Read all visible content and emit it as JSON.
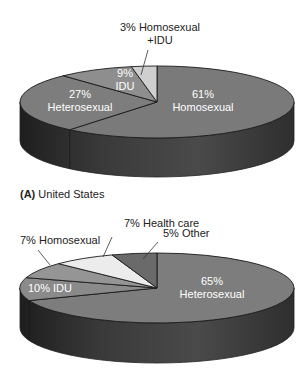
{
  "figure": {
    "panel_label_letter": "(A)",
    "panel_label_text": "United States"
  },
  "chart_data": [
    {
      "type": "pie",
      "style": "3d",
      "title": "",
      "categories": [
        "Homosexual",
        "Heterosexual",
        "IDU",
        "Homosexual +IDU"
      ],
      "values": [
        61,
        27,
        9,
        3
      ],
      "labels": [
        {
          "lines": [
            "61%",
            "Homosexual"
          ],
          "x": 203,
          "y": 98,
          "color": "#ffffff",
          "anchor": "middle"
        },
        {
          "lines": [
            "27%",
            "Heterosexual"
          ],
          "x": 80,
          "y": 98,
          "color": "#ffffff",
          "anchor": "middle"
        },
        {
          "lines": [
            "9%",
            "IDU"
          ],
          "x": 125,
          "y": 77,
          "color": "#ffffff",
          "anchor": "middle"
        },
        {
          "lines": [
            "3% Homosexual",
            "+IDU"
          ],
          "x": 160,
          "y": 31,
          "color": "#222222",
          "anchor": "middle",
          "leader": [
            148,
            50,
            141,
            75
          ]
        }
      ],
      "colors": [
        "#7a7a7a",
        "#7d7d7d",
        "#8e8e8e",
        "#cfcfcf"
      ],
      "side_colors": [
        "#4a4a4a",
        "#2a2a2a"
      ],
      "start_angle_deg": 0,
      "direction": "clockwise",
      "geometry": {
        "cx": 157,
        "cy": 102,
        "rx": 137,
        "ry": 36,
        "depth": 39
      }
    },
    {
      "type": "pie",
      "style": "3d",
      "title": "",
      "categories": [
        "Heterosexual",
        "IDU",
        "Homosexual",
        "Health care",
        "Other"
      ],
      "values": [
        65,
        10,
        7,
        7,
        5
      ],
      "labels": [
        {
          "lines": [
            "65%",
            "Heterosexual"
          ],
          "x": 212,
          "y": 285,
          "color": "#ffffff",
          "anchor": "middle"
        },
        {
          "lines": [
            "10% IDU"
          ],
          "x": 50,
          "y": 292,
          "color": "#ffffff",
          "anchor": "middle"
        },
        {
          "lines": [
            "7% Homosexual"
          ],
          "x": 20,
          "y": 244,
          "color": "#222222",
          "anchor": "start",
          "leader": [
            38,
            250,
            50,
            265
          ]
        },
        {
          "lines": [
            "7% Health care"
          ],
          "x": 124,
          "y": 227,
          "color": "#222222",
          "anchor": "start",
          "leader": [
            112,
            237,
            103,
            257
          ]
        },
        {
          "lines": [
            "5% Other"
          ],
          "x": 163,
          "y": 237,
          "color": "#222222",
          "anchor": "start",
          "leader": [
            158,
            242,
            143,
            259
          ]
        }
      ],
      "colors": [
        "#7d7d7d",
        "#8a8a8a",
        "#959595",
        "#ececec",
        "#6a6a6a"
      ],
      "side_colors": [
        "#4a4a4a",
        "#2a2a2a"
      ],
      "start_angle_deg": 0,
      "direction": "clockwise",
      "geometry": {
        "cx": 157,
        "cy": 288,
        "rx": 137,
        "ry": 35,
        "depth": 40
      }
    }
  ]
}
